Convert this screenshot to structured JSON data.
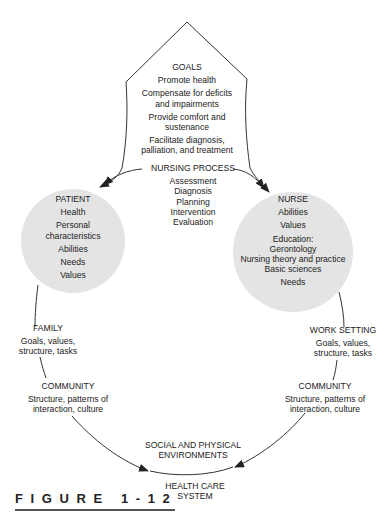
{
  "goals": {
    "title": "GOALS",
    "items": [
      [
        "Promote health"
      ],
      [
        "Compensate for deficits",
        "and impairments"
      ],
      [
        "Provide comfort and",
        "sustenance"
      ],
      [
        "Facilitate diagnosis,",
        "palliation, and treatment"
      ]
    ]
  },
  "nursing_process": {
    "title": "NURSING PROCESS",
    "steps": [
      "Assessment",
      "Diagnosis",
      "Planning",
      "Intervention",
      "Evaluation"
    ]
  },
  "patient": {
    "title": "PATIENT",
    "items": [
      "Health",
      "Personal characteristics",
      "Abilities",
      "Needs",
      "Values"
    ],
    "personal_line1": "Personal",
    "personal_line2": "characteristics"
  },
  "nurse": {
    "title": "NURSE",
    "items": [
      "Abilities",
      "Values"
    ],
    "education_title": "Education:",
    "education": [
      "Gerontology",
      "Nursing theory and practice",
      "Basic sciences"
    ],
    "needs": "Needs"
  },
  "family": {
    "title": "FAMILY",
    "line1": "Goals, values,",
    "line2": "structure, tasks"
  },
  "work_setting": {
    "title": "WORK SETTING",
    "line1": "Goals, values,",
    "line2": "structure, tasks"
  },
  "community_left": {
    "title": "COMMUNITY",
    "line1": "Structure, patterns of",
    "line2": "interaction, culture"
  },
  "community_right": {
    "title": "COMMUNITY",
    "line1": "Structure, patterns of",
    "line2": "interaction, culture"
  },
  "environments": {
    "line1": "SOCIAL AND PHYSICAL",
    "line2": "ENVIRONMENTS"
  },
  "health_care": {
    "line1": "HEALTH CARE",
    "line2": "SYSTEM"
  },
  "figure_label": "FIGURE 1-12",
  "colors": {
    "circle_fill": "#e4e4e4",
    "stroke": "#333333"
  }
}
